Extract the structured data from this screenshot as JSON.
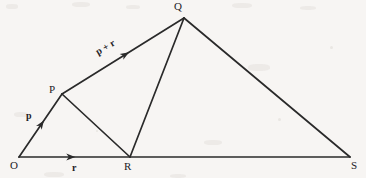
{
  "figure": {
    "type": "vector-addition-triangle-diagram",
    "canvas": {
      "width": 366,
      "height": 178
    },
    "background_color": "#f7f5f3",
    "stroke_color": "#2a2a2a",
    "text_color": "#23211f"
  },
  "vertices": [
    {
      "id": "O",
      "label": "O",
      "x": 19,
      "y": 157,
      "label_x": 10,
      "label_y": 160
    },
    {
      "id": "P",
      "label": "P",
      "x": 62,
      "y": 94,
      "label_x": 49,
      "label_y": 84
    },
    {
      "id": "Q",
      "label": "Q",
      "x": 184,
      "y": 18,
      "label_x": 174,
      "label_y": 1
    },
    {
      "id": "R",
      "label": "R",
      "x": 130,
      "y": 157,
      "label_x": 124,
      "label_y": 161
    },
    {
      "id": "S",
      "label": "S",
      "x": 350,
      "y": 157,
      "label_x": 351,
      "label_y": 160
    }
  ],
  "segments": [
    {
      "id": "OP",
      "from": "O",
      "to": "P",
      "arrow": true,
      "arrow_at": 0.58
    },
    {
      "id": "PQ",
      "from": "P",
      "to": "Q",
      "arrow": true,
      "arrow_at": 0.55
    },
    {
      "id": "OS",
      "from": "O",
      "to": "S",
      "arrow": true,
      "arrow_at": 0.17
    },
    {
      "id": "PR",
      "from": "P",
      "to": "R",
      "arrow": false,
      "arrow_at": 0
    },
    {
      "id": "QR",
      "from": "Q",
      "to": "R",
      "arrow": false,
      "arrow_at": 0
    },
    {
      "id": "QS",
      "from": "Q",
      "to": "S",
      "arrow": false,
      "arrow_at": 0
    }
  ],
  "vector_labels": [
    {
      "id": "p",
      "text": "p",
      "x": 26,
      "y": 111,
      "rotated": false
    },
    {
      "id": "r",
      "text": "r",
      "x": 72,
      "y": 163,
      "rotated": false
    },
    {
      "id": "p_r",
      "text": "p + r",
      "x": 99,
      "y": 54,
      "rotated": true
    }
  ]
}
